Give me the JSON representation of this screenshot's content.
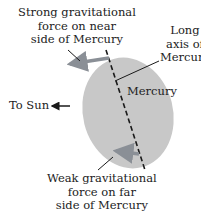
{
  "labels": {
    "strong_force": [
      "Strong gravitational",
      "force on near",
      "side of Mercury"
    ],
    "long_axis": [
      "Long",
      "axis of",
      "Mercury"
    ],
    "planet": "Mercury",
    "sun": "To Sun",
    "weak_force": [
      "Weak gravitational",
      "force on far",
      "side of Mercury"
    ]
  },
  "colors": {
    "planet": "#c8c8c8",
    "arrow": "#8a8f96",
    "line": "#1a1a1a"
  }
}
